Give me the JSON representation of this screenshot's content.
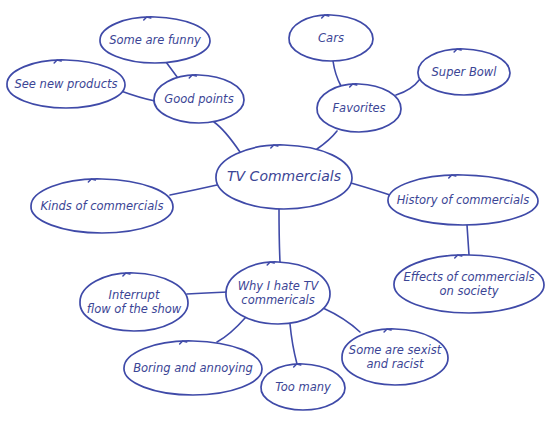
{
  "diagram": {
    "type": "mind-map",
    "colors": {
      "stroke": "#3f4aa8",
      "text": "#3b4595",
      "background": "#ffffff"
    },
    "nodes": [
      {
        "id": "center",
        "lines": [
          "TV Commercials"
        ],
        "cx": 284,
        "cy": 177,
        "rx": 68,
        "ry": 32,
        "center": true
      },
      {
        "id": "good",
        "lines": [
          "Good points"
        ],
        "cx": 199,
        "cy": 99,
        "rx": 45,
        "ry": 24
      },
      {
        "id": "funny",
        "lines": [
          "Some are funny"
        ],
        "cx": 155,
        "cy": 40,
        "rx": 55,
        "ry": 23
      },
      {
        "id": "newprod",
        "lines": [
          "See new products"
        ],
        "cx": 66,
        "cy": 84,
        "rx": 59,
        "ry": 24
      },
      {
        "id": "fav",
        "lines": [
          "Favorites"
        ],
        "cx": 359,
        "cy": 108,
        "rx": 42,
        "ry": 24
      },
      {
        "id": "cars",
        "lines": [
          "Cars"
        ],
        "cx": 331,
        "cy": 38,
        "rx": 42,
        "ry": 23
      },
      {
        "id": "super",
        "lines": [
          "Super Bowl"
        ],
        "cx": 464,
        "cy": 72,
        "rx": 46,
        "ry": 23
      },
      {
        "id": "kinds",
        "lines": [
          "Kinds of commercials"
        ],
        "cx": 102,
        "cy": 206,
        "rx": 71,
        "ry": 27
      },
      {
        "id": "history",
        "lines": [
          "History of commercials"
        ],
        "cx": 463,
        "cy": 200,
        "rx": 75,
        "ry": 25
      },
      {
        "id": "effects",
        "lines": [
          "Effects of commercials",
          "on society"
        ],
        "cx": 469,
        "cy": 284,
        "rx": 75,
        "ry": 29
      },
      {
        "id": "hate",
        "lines": [
          "Why I hate TV",
          "commericals"
        ],
        "cx": 278,
        "cy": 293,
        "rx": 52,
        "ry": 31
      },
      {
        "id": "interrupt",
        "lines": [
          "Interrupt",
          "flow of the show"
        ],
        "cx": 134,
        "cy": 302,
        "rx": 54,
        "ry": 29
      },
      {
        "id": "boring",
        "lines": [
          "Boring and annoying"
        ],
        "cx": 193,
        "cy": 368,
        "rx": 69,
        "ry": 27
      },
      {
        "id": "toomany",
        "lines": [
          "Too many"
        ],
        "cx": 303,
        "cy": 387,
        "rx": 42,
        "ry": 23
      },
      {
        "id": "sexist",
        "lines": [
          "Some are sexist",
          "and racist"
        ],
        "cx": 395,
        "cy": 357,
        "rx": 53,
        "ry": 28
      }
    ],
    "edges": [
      {
        "from": "center",
        "to": "good",
        "path": "M240,152 Q225,130 214,122"
      },
      {
        "from": "good",
        "to": "funny",
        "path": "M180,81 Q172,70 166,62"
      },
      {
        "from": "good",
        "to": "newprod",
        "path": "M155,101 Q140,98 121,91"
      },
      {
        "from": "center",
        "to": "fav",
        "path": "M317,149 Q330,140 337,131"
      },
      {
        "from": "fav",
        "to": "cars",
        "path": "M341,86 Q335,75 333,61"
      },
      {
        "from": "fav",
        "to": "super",
        "path": "M396,95 Q412,90 420,79"
      },
      {
        "from": "center",
        "to": "kinds",
        "path": "M217,185 Q195,190 170,195"
      },
      {
        "from": "center",
        "to": "history",
        "path": "M351,183 Q375,190 390,195"
      },
      {
        "from": "history",
        "to": "effects",
        "path": "M467,225 L469,255"
      },
      {
        "from": "center",
        "to": "hate",
        "path": "M279,209 Q279,240 280,262"
      },
      {
        "from": "hate",
        "to": "interrupt",
        "path": "M228,292 Q205,293 187,294"
      },
      {
        "from": "hate",
        "to": "boring",
        "path": "M246,317 Q230,335 217,342"
      },
      {
        "from": "hate",
        "to": "toomany",
        "path": "M290,324 Q292,345 297,364"
      },
      {
        "from": "hate",
        "to": "sexist",
        "path": "M323,308 Q345,318 360,332"
      }
    ]
  }
}
